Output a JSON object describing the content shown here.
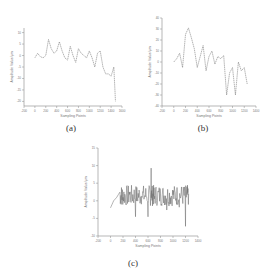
{
  "captions": {
    "a": "(a)",
    "b": "(b)",
    "c": "(c)"
  },
  "chart_data": [
    {
      "id": "a",
      "type": "line",
      "xlabel": "Sampling Points",
      "ylabel": "Amplitude Value/μm",
      "xticks": [
        "-200",
        "0",
        "200",
        "400",
        "600",
        "800",
        "1000",
        "1200",
        "1400",
        "1600"
      ],
      "yticks": [
        "-20",
        "-15",
        "-10",
        "-5",
        "0",
        "5",
        "10"
      ],
      "xlim": [
        -200,
        1600
      ],
      "ylim": [
        -22,
        12
      ],
      "x": [
        0,
        50,
        100,
        150,
        200,
        250,
        300,
        350,
        400,
        450,
        500,
        550,
        600,
        650,
        700,
        750,
        800,
        850,
        900,
        950,
        1000,
        1050,
        1100,
        1150,
        1200,
        1250,
        1300,
        1350,
        1400,
        1450,
        1480
      ],
      "values": [
        -1,
        1,
        -0.5,
        -1,
        0,
        7,
        3,
        1,
        2,
        6,
        2,
        -1,
        -2,
        4,
        0,
        -3,
        3,
        1,
        0,
        -1,
        2,
        -1,
        -5,
        1,
        2,
        -5,
        -8,
        -8,
        -9,
        -5,
        -20
      ]
    },
    {
      "id": "b",
      "type": "line",
      "xlabel": "Sampling Points",
      "ylabel": "Amplitude Value/μm",
      "xticks": [
        "-200",
        "0",
        "200",
        "400",
        "600",
        "800",
        "1000",
        "1200",
        "1400"
      ],
      "yticks": [
        "-40",
        "-30",
        "-20",
        "-10",
        "0",
        "10",
        "20",
        "30",
        "40"
      ],
      "xlim": [
        -200,
        1400
      ],
      "ylim": [
        -40,
        40
      ],
      "x": [
        0,
        50,
        100,
        150,
        200,
        250,
        300,
        350,
        400,
        450,
        500,
        550,
        600,
        650,
        700,
        750,
        800,
        850,
        900,
        950,
        1000,
        1050,
        1100,
        1150,
        1200,
        1250
      ],
      "values": [
        0,
        3,
        8,
        -5,
        25,
        31,
        22,
        12,
        -5,
        5,
        15,
        -8,
        5,
        10,
        -2,
        5,
        3,
        6,
        -30,
        -10,
        -5,
        -30,
        0,
        -8,
        -5,
        -20
      ]
    },
    {
      "id": "c",
      "type": "line",
      "xlabel": "Sampling Points",
      "ylabel": "Amplitude Value/μm",
      "xticks": [
        "-200",
        "0",
        "200",
        "400",
        "600",
        "800",
        "1000",
        "1200",
        "1400"
      ],
      "yticks": [
        "-10",
        "-5",
        "0",
        "5",
        "10",
        "15"
      ],
      "xlim": [
        -200,
        1400
      ],
      "ylim": [
        -10,
        15
      ],
      "description": "Noisy high-frequency signal oscillating around ~1-2 μm with spikes to ~11 and -7; initial ramp from ~-2 at x=0 to ~2 at x=150",
      "x": [
        0,
        50,
        100,
        150,
        200,
        300,
        400,
        500,
        600,
        650,
        700,
        800,
        900,
        1000,
        1100,
        1200,
        1250
      ],
      "values": [
        -2,
        0,
        1,
        2.5,
        1,
        3,
        -2,
        4,
        -6,
        11,
        0,
        4,
        -1,
        2,
        1,
        -7,
        2
      ]
    }
  ]
}
